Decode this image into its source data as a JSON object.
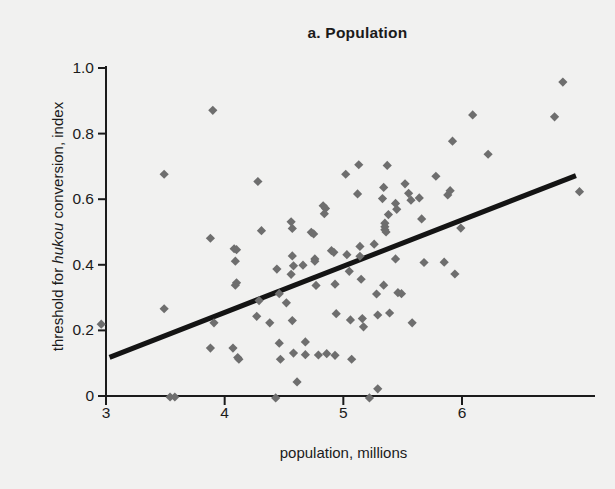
{
  "chart_data": {
    "type": "scatter",
    "title": "a. Population",
    "xlabel": "population, millions",
    "ylabel_prefix": "threshold for ",
    "ylabel_italic": "hukou",
    "ylabel_suffix": " conversion, index",
    "ylabel_full": "threshold for hukou conversion, index",
    "xlim": [
      2.92,
      7.05
    ],
    "ylim": [
      0,
      1.0
    ],
    "xticks": [
      3,
      4,
      5,
      6
    ],
    "xtick_labels": [
      "3",
      "4",
      "5",
      "6"
    ],
    "yticks": [
      0,
      0.2,
      0.4,
      0.6,
      0.8,
      1.0
    ],
    "ytick_labels": [
      "0",
      "0.2",
      "0.4",
      "0.6",
      "0.8",
      "1.0"
    ],
    "grid": false,
    "legend": "none",
    "marker": "diamond",
    "marker_color": "#6e6e6e",
    "axis_color": "#1b1b1b",
    "background_color": "#f1f1f0",
    "trendline": {
      "name": "linear fit",
      "color": "#141414",
      "width_px": 5,
      "x_start": 3.03,
      "y_start": 0.118,
      "x_end": 6.96,
      "y_end": 0.672,
      "slope": 0.141,
      "intercept": -0.309
    },
    "series": [
      {
        "name": "cities",
        "points": [
          [
            2.96,
            0.219
          ],
          [
            3.49,
            0.676
          ],
          [
            3.49,
            0.266
          ],
          [
            3.54,
            -0.003
          ],
          [
            3.58,
            -0.003
          ],
          [
            3.9,
            0.871
          ],
          [
            3.88,
            0.481
          ],
          [
            3.91,
            0.223
          ],
          [
            3.88,
            0.146
          ],
          [
            4.08,
            0.449
          ],
          [
            4.1,
            0.446
          ],
          [
            4.09,
            0.411
          ],
          [
            4.1,
            0.345
          ],
          [
            4.09,
            0.338
          ],
          [
            4.07,
            0.146
          ],
          [
            4.11,
            0.117
          ],
          [
            4.12,
            0.112
          ],
          [
            4.28,
            0.654
          ],
          [
            4.29,
            0.291
          ],
          [
            4.27,
            0.243
          ],
          [
            4.31,
            0.504
          ],
          [
            4.38,
            0.223
          ],
          [
            4.43,
            -0.006
          ],
          [
            4.44,
            0.387
          ],
          [
            4.46,
            0.312
          ],
          [
            4.46,
            0.161
          ],
          [
            4.47,
            0.112
          ],
          [
            4.52,
            0.284
          ],
          [
            4.56,
            0.531
          ],
          [
            4.57,
            0.511
          ],
          [
            4.57,
            0.427
          ],
          [
            4.58,
            0.397
          ],
          [
            4.56,
            0.371
          ],
          [
            4.57,
            0.23
          ],
          [
            4.58,
            0.131
          ],
          [
            4.61,
            0.043
          ],
          [
            4.66,
            0.399
          ],
          [
            4.68,
            0.165
          ],
          [
            4.68,
            0.126
          ],
          [
            4.73,
            0.499
          ],
          [
            4.75,
            0.494
          ],
          [
            4.76,
            0.418
          ],
          [
            4.76,
            0.411
          ],
          [
            4.77,
            0.337
          ],
          [
            4.79,
            0.125
          ],
          [
            4.83,
            0.58
          ],
          [
            4.85,
            0.572
          ],
          [
            4.84,
            0.556
          ],
          [
            4.86,
            0.129
          ],
          [
            4.9,
            0.443
          ],
          [
            4.92,
            0.438
          ],
          [
            4.93,
            0.341
          ],
          [
            4.94,
            0.251
          ],
          [
            4.93,
            0.124
          ],
          [
            5.02,
            0.676
          ],
          [
            5.03,
            0.431
          ],
          [
            5.05,
            0.38
          ],
          [
            5.06,
            0.232
          ],
          [
            5.07,
            0.112
          ],
          [
            5.12,
            0.616
          ],
          [
            5.13,
            0.705
          ],
          [
            5.14,
            0.456
          ],
          [
            5.14,
            0.426
          ],
          [
            5.15,
            0.356
          ],
          [
            5.16,
            0.236
          ],
          [
            5.17,
            0.211
          ],
          [
            5.22,
            -0.006
          ],
          [
            5.26,
            0.463
          ],
          [
            5.28,
            0.311
          ],
          [
            5.29,
            0.247
          ],
          [
            5.29,
            0.022
          ],
          [
            5.33,
            0.602
          ],
          [
            5.34,
            0.636
          ],
          [
            5.35,
            0.527
          ],
          [
            5.35,
            0.516
          ],
          [
            5.35,
            0.507
          ],
          [
            5.36,
            0.5
          ],
          [
            5.34,
            0.338
          ],
          [
            5.37,
            0.703
          ],
          [
            5.38,
            0.553
          ],
          [
            5.39,
            0.253
          ],
          [
            5.44,
            0.587
          ],
          [
            5.45,
            0.569
          ],
          [
            5.44,
            0.418
          ],
          [
            5.46,
            0.315
          ],
          [
            5.49,
            0.312
          ],
          [
            5.52,
            0.647
          ],
          [
            5.55,
            0.618
          ],
          [
            5.57,
            0.597
          ],
          [
            5.58,
            0.223
          ],
          [
            5.64,
            0.604
          ],
          [
            5.66,
            0.54
          ],
          [
            5.68,
            0.407
          ],
          [
            5.78,
            0.67
          ],
          [
            5.85,
            0.408
          ],
          [
            5.88,
            0.613
          ],
          [
            5.9,
            0.626
          ],
          [
            5.92,
            0.777
          ],
          [
            5.94,
            0.372
          ],
          [
            5.99,
            0.512
          ],
          [
            6.09,
            0.857
          ],
          [
            6.22,
            0.737
          ],
          [
            6.78,
            0.851
          ],
          [
            6.85,
            0.957
          ],
          [
            6.99,
            0.623
          ]
        ]
      }
    ]
  }
}
